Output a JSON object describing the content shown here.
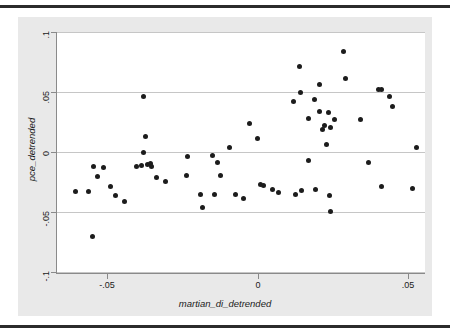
{
  "figure": {
    "background_color": "#e9e9e9",
    "plot_background_color": "#ffffff",
    "grid_color": "#c6c6c6",
    "axis_color": "#8a8a8a",
    "marker_color": "#1c1c1c",
    "rule_color": "#2b2b2b"
  },
  "chart_data": {
    "type": "scatter",
    "title": "",
    "xlabel": "martian_di_detrended",
    "ylabel": "pce_detrended",
    "xlim": [
      -0.0665,
      0.0555
    ],
    "ylim": [
      -0.1,
      0.1
    ],
    "xticks": [
      -0.05,
      0,
      0.05
    ],
    "xticklabels": [
      "-.05",
      "0",
      ".05"
    ],
    "yticks": [
      -0.1,
      -0.05,
      0,
      0.05,
      0.1
    ],
    "yticklabels": [
      "-.1",
      "-.05",
      "0",
      ".05",
      ".1"
    ],
    "grid": "horizontal",
    "legend": "none",
    "marker": "filled-circle",
    "n_points": 66,
    "points": [
      {
        "x": -0.0605,
        "y": -0.0332
      },
      {
        "x": -0.0562,
        "y": -0.033
      },
      {
        "x": -0.0545,
        "y": -0.012
      },
      {
        "x": -0.053,
        "y": -0.0206
      },
      {
        "x": -0.0512,
        "y": -0.0128
      },
      {
        "x": -0.0548,
        "y": -0.07
      },
      {
        "x": -0.0487,
        "y": -0.0284
      },
      {
        "x": -0.0472,
        "y": -0.0365
      },
      {
        "x": -0.044,
        "y": -0.041
      },
      {
        "x": -0.0378,
        "y": 0.0465
      },
      {
        "x": -0.0373,
        "y": 0.0133
      },
      {
        "x": -0.038,
        "y": 0.0
      },
      {
        "x": -0.0384,
        "y": -0.0112
      },
      {
        "x": -0.0364,
        "y": -0.0105
      },
      {
        "x": -0.0356,
        "y": -0.0098
      },
      {
        "x": -0.0352,
        "y": -0.012
      },
      {
        "x": -0.0334,
        "y": -0.0208
      },
      {
        "x": -0.0306,
        "y": -0.0245
      },
      {
        "x": -0.0237,
        "y": -0.0196
      },
      {
        "x": -0.0232,
        "y": -0.0033
      },
      {
        "x": -0.019,
        "y": -0.0355
      },
      {
        "x": -0.0184,
        "y": -0.0465
      },
      {
        "x": -0.0148,
        "y": -0.0028
      },
      {
        "x": -0.0144,
        "y": -0.0356
      },
      {
        "x": -0.0132,
        "y": -0.0085
      },
      {
        "x": -0.0124,
        "y": -0.0198
      },
      {
        "x": -0.0094,
        "y": 0.0041
      },
      {
        "x": -0.0072,
        "y": -0.0352
      },
      {
        "x": -0.0048,
        "y": -0.0385
      },
      {
        "x": -0.0026,
        "y": 0.0235
      },
      {
        "x": 0.0001,
        "y": 0.0113
      },
      {
        "x": 0.0008,
        "y": -0.0272
      },
      {
        "x": 0.0018,
        "y": -0.0279
      },
      {
        "x": 0.0048,
        "y": -0.0312
      },
      {
        "x": 0.007,
        "y": -0.0338
      },
      {
        "x": 0.012,
        "y": 0.0418
      },
      {
        "x": 0.014,
        "y": 0.0715
      },
      {
        "x": 0.0142,
        "y": 0.05
      },
      {
        "x": 0.0146,
        "y": -0.0317
      },
      {
        "x": 0.0168,
        "y": 0.0277
      },
      {
        "x": 0.017,
        "y": -0.0068
      },
      {
        "x": 0.0189,
        "y": 0.044
      },
      {
        "x": 0.0192,
        "y": -0.031
      },
      {
        "x": 0.0205,
        "y": 0.0562
      },
      {
        "x": 0.0214,
        "y": 0.0192
      },
      {
        "x": 0.0222,
        "y": 0.0222
      },
      {
        "x": 0.0228,
        "y": 0.0065
      },
      {
        "x": 0.0236,
        "y": 0.0326
      },
      {
        "x": 0.0239,
        "y": -0.0358
      },
      {
        "x": 0.0241,
        "y": 0.0203
      },
      {
        "x": 0.0243,
        "y": -0.0498
      },
      {
        "x": 0.0254,
        "y": 0.0272
      },
      {
        "x": 0.0286,
        "y": 0.0838
      },
      {
        "x": 0.0292,
        "y": 0.0613
      },
      {
        "x": 0.034,
        "y": 0.0274
      },
      {
        "x": 0.0366,
        "y": -0.0085
      },
      {
        "x": 0.04,
        "y": 0.0522
      },
      {
        "x": 0.0409,
        "y": 0.0518
      },
      {
        "x": 0.041,
        "y": -0.029
      },
      {
        "x": 0.0438,
        "y": 0.0465
      },
      {
        "x": 0.0447,
        "y": 0.0382
      },
      {
        "x": 0.0512,
        "y": -0.0303
      },
      {
        "x": 0.0528,
        "y": 0.0042
      },
      {
        "x": -0.0402,
        "y": -0.0118
      },
      {
        "x": 0.0206,
        "y": 0.0338
      },
      {
        "x": 0.0126,
        "y": -0.0355
      }
    ]
  }
}
